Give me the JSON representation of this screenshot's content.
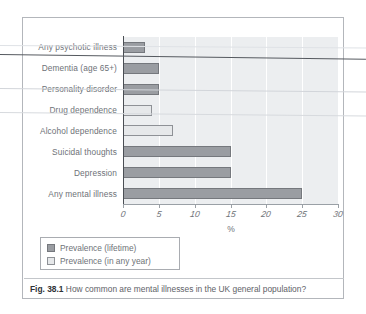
{
  "figure": {
    "caption_label": "Fig. 38.1",
    "caption_text": "How common are mental illnesses in the UK general population?"
  },
  "legend": {
    "items": [
      {
        "label": "Prevalence (lifetime)",
        "color": "#9a9da2",
        "series": "lifetime"
      },
      {
        "label": "Prevalence (in any year)",
        "color": "#e6e8ea",
        "series": "any_year"
      }
    ]
  },
  "chart_data": {
    "type": "bar",
    "orientation": "horizontal",
    "title": "",
    "xlabel": "%",
    "ylabel": "",
    "xlim": [
      0,
      30
    ],
    "xticks": [
      0,
      5,
      10,
      15,
      20,
      25,
      30
    ],
    "xtick_labels": [
      "0",
      "5",
      "10",
      "15",
      "20",
      "25",
      "30"
    ],
    "grid": "vertical-white-on-gray",
    "legend_position": "below-axes-left",
    "categories": [
      "Any psychotic illness",
      "Dementia (age 65+)",
      "Personality disorder",
      "Drug dependence",
      "Alcohol dependence",
      "Suicidal thoughts",
      "Depression",
      "Any mental illness"
    ],
    "series": [
      {
        "name": "Prevalence (lifetime)",
        "color": "#9a9da2",
        "values": [
          3,
          5,
          5,
          null,
          null,
          15,
          15,
          25
        ]
      },
      {
        "name": "Prevalence (in any year)",
        "color": "#e6e8ea",
        "values": [
          null,
          null,
          null,
          4,
          7,
          null,
          null,
          null
        ]
      }
    ],
    "bars": [
      {
        "category": "Any psychotic illness",
        "value": 3,
        "series": "lifetime"
      },
      {
        "category": "Dementia (age 65+)",
        "value": 5,
        "series": "lifetime"
      },
      {
        "category": "Personality disorder",
        "value": 5,
        "series": "lifetime"
      },
      {
        "category": "Drug dependence",
        "value": 4,
        "series": "any_year"
      },
      {
        "category": "Alcohol dependence",
        "value": 7,
        "series": "any_year"
      },
      {
        "category": "Suicidal thoughts",
        "value": 15,
        "series": "lifetime"
      },
      {
        "category": "Depression",
        "value": 15,
        "series": "lifetime"
      },
      {
        "category": "Any mental illness",
        "value": 25,
        "series": "lifetime"
      }
    ]
  }
}
